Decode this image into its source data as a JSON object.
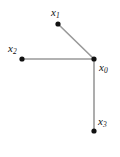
{
  "figure": {
    "type": "graph-diagram",
    "background_color": "#ffffff",
    "width": 120,
    "height": 157
  },
  "style": {
    "edge_color": "#999999",
    "edge_width": 1.6,
    "node_color": "#111111",
    "node_radius": 2.6,
    "label_color": "#111111"
  },
  "graph": {
    "nodes": [
      {
        "id": "x0",
        "label_base": "x",
        "label_sub": "0",
        "x": 94,
        "y": 59,
        "label_x": 99,
        "label_y": 62
      },
      {
        "id": "x1",
        "label_base": "x",
        "label_sub": "1",
        "x": 58,
        "y": 24,
        "label_x": 51,
        "label_y": 7
      },
      {
        "id": "x2",
        "label_base": "x",
        "label_sub": "2",
        "x": 22,
        "y": 59,
        "label_x": 8,
        "label_y": 43
      },
      {
        "id": "x3",
        "label_base": "x",
        "label_sub": "3",
        "x": 94,
        "y": 131,
        "label_x": 98,
        "label_y": 116
      }
    ],
    "edges": [
      {
        "id": "edge-x1-x0",
        "from": "x1",
        "to": "x0",
        "x1": 58,
        "y1": 24,
        "x2": 94,
        "y2": 59
      },
      {
        "id": "edge-x2-x0",
        "from": "x2",
        "to": "x0",
        "x1": 22,
        "y1": 59,
        "x2": 94,
        "y2": 59
      },
      {
        "id": "edge-x0-x3",
        "from": "x0",
        "to": "x3",
        "x1": 94,
        "y1": 59,
        "x2": 94,
        "y2": 131
      }
    ]
  }
}
